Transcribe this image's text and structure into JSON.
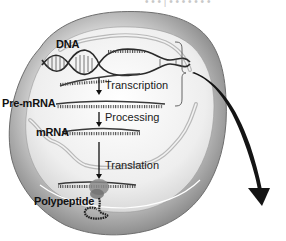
{
  "figure": {
    "top_caption_partial": "• • •  |  • • • • • • •",
    "labels": {
      "dna": "DNA",
      "pre_mrna": "Pre-mRNA",
      "mrna": "mRNA",
      "polypeptide": "Polypeptide"
    },
    "steps": [
      {
        "label": "Transcription"
      },
      {
        "label": "Processing"
      },
      {
        "label": "Translation"
      }
    ],
    "colors": {
      "cell_outer": "#8a8a8a",
      "cell_mid": "#bdbdbd",
      "cell_inner": "#efefef",
      "strand": "#3a3a3a",
      "ribosome": "#7a7a7a",
      "arrow": "#111111"
    }
  }
}
